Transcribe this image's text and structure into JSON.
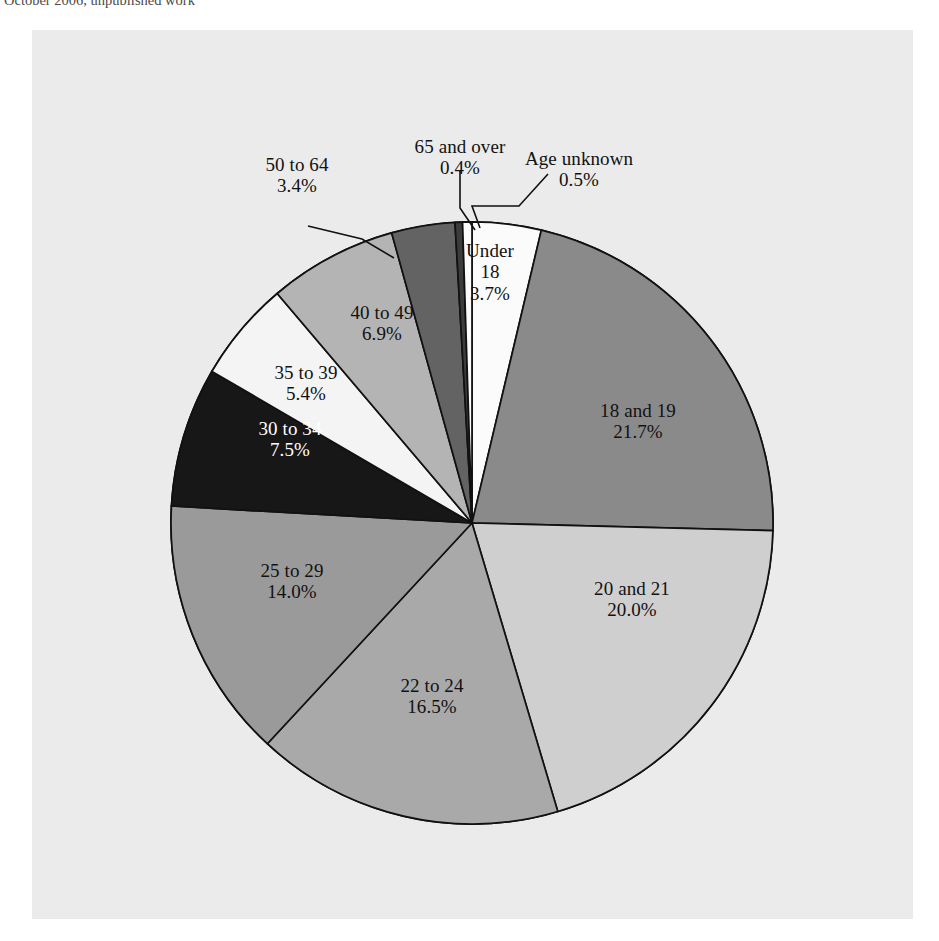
{
  "caption": {
    "text": "October 2006, unpublished work"
  },
  "panel": {
    "background_color": "#ebebeb"
  },
  "chart_data": {
    "type": "pie",
    "title": "",
    "subtitle": "",
    "xlabel": "",
    "ylabel": "",
    "legend_position": "none",
    "grid": false,
    "units": "percent",
    "total": 100.0,
    "start_angle_deg": -90,
    "direction": "clockwise",
    "categories": [
      "Under 18",
      "18 and 19",
      "20 and 21",
      "22 to 24",
      "25 to 29",
      "30 to 34",
      "35 to 39",
      "40 to 49",
      "50 to 64",
      "65 and over",
      "Age unknown"
    ],
    "values": [
      3.7,
      21.7,
      20.0,
      16.5,
      14.0,
      7.5,
      5.4,
      6.9,
      3.4,
      0.4,
      0.5
    ],
    "slices": [
      {
        "label": "Under 18",
        "label_line1": "Under",
        "label_line2": "18",
        "value": 3.7,
        "percent_text": "3.7%",
        "color": "#fbfbfb",
        "text_color": "#121212",
        "label_placement": "inside",
        "leader_line": false
      },
      {
        "label": "18 and 19",
        "label_line1": "18 and 19",
        "label_line2": "",
        "value": 21.7,
        "percent_text": "21.7%",
        "color": "#8a8a8a",
        "text_color": "#121212",
        "label_placement": "inside",
        "leader_line": false
      },
      {
        "label": "20 and 21",
        "label_line1": "20 and 21",
        "label_line2": "",
        "value": 20.0,
        "percent_text": "20.0%",
        "color": "#cfcfcf",
        "text_color": "#121212",
        "label_placement": "inside",
        "leader_line": false
      },
      {
        "label": "22 to 24",
        "label_line1": "22 to 24",
        "label_line2": "",
        "value": 16.5,
        "percent_text": "16.5%",
        "color": "#a9a9a9",
        "text_color": "#121212",
        "label_placement": "inside",
        "leader_line": false
      },
      {
        "label": "25 to 29",
        "label_line1": "25 to 29",
        "label_line2": "",
        "value": 14.0,
        "percent_text": "14.0%",
        "color": "#9a9a9a",
        "text_color": "#121212",
        "label_placement": "inside",
        "leader_line": false
      },
      {
        "label": "30 to 34",
        "label_line1": "30 to 34",
        "label_line2": "",
        "value": 7.5,
        "percent_text": "7.5%",
        "color": "#171717",
        "text_color": "#ffffff",
        "label_placement": "inside",
        "leader_line": false
      },
      {
        "label": "35 to 39",
        "label_line1": "35 to 39",
        "label_line2": "",
        "value": 5.4,
        "percent_text": "5.4%",
        "color": "#f4f4f4",
        "text_color": "#121212",
        "label_placement": "inside",
        "leader_line": false
      },
      {
        "label": "40 to 49",
        "label_line1": "40 to 49",
        "label_line2": "",
        "value": 6.9,
        "percent_text": "6.9%",
        "color": "#b4b4b4",
        "text_color": "#121212",
        "label_placement": "inside",
        "leader_line": false
      },
      {
        "label": "50 to 64",
        "label_line1": "50 to 64",
        "label_line2": "",
        "value": 3.4,
        "percent_text": "3.4%",
        "color": "#636363",
        "text_color": "#121212",
        "label_placement": "outside",
        "leader_line": true
      },
      {
        "label": "65 and over",
        "label_line1": "65 and over",
        "label_line2": "",
        "value": 0.4,
        "percent_text": "0.4%",
        "color": "#3c3c3c",
        "text_color": "#121212",
        "label_placement": "outside",
        "leader_line": true
      },
      {
        "label": "Age unknown",
        "label_line1": "Age unknown",
        "label_line2": "",
        "value": 0.5,
        "percent_text": "0.5%",
        "color": "#fbfbfb",
        "text_color": "#121212",
        "label_placement": "outside",
        "leader_line": true
      }
    ]
  }
}
